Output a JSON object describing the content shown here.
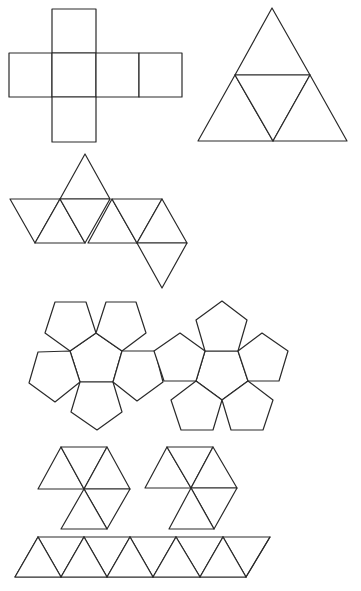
{
  "diagram": {
    "stroke_color": "#2a2a2a",
    "background": "#ffffff",
    "nets": [
      {
        "name": "cube-net",
        "solid": "cube",
        "face_shape": "square",
        "face_count": 6,
        "squares": [
          [
            52,
            9,
            44,
            44
          ],
          [
            9,
            53,
            43,
            44
          ],
          [
            52,
            53,
            44,
            44
          ],
          [
            96,
            53,
            43,
            44
          ],
          [
            139,
            53,
            43,
            44
          ],
          [
            52,
            97,
            44,
            45
          ]
        ]
      },
      {
        "name": "tetrahedron-net",
        "solid": "tetrahedron",
        "face_shape": "triangle",
        "face_count": 4,
        "triangles": [
          [
            [
              272,
              8
            ],
            [
              235,
              75
            ],
            [
              310,
              75
            ]
          ],
          [
            [
              235,
              75
            ],
            [
              198,
              141
            ],
            [
              273,
              141
            ]
          ],
          [
            [
              235,
              75
            ],
            [
              310,
              75
            ],
            [
              273,
              141
            ]
          ],
          [
            [
              310,
              75
            ],
            [
              273,
              141
            ],
            [
              347,
              141
            ]
          ]
        ]
      },
      {
        "name": "octahedron-net",
        "solid": "octahedron",
        "face_shape": "triangle",
        "face_count": 8,
        "triangles": [
          [
            [
              85,
              154
            ],
            [
              60,
              199
            ],
            [
              110,
              199
            ]
          ],
          [
            [
              10,
              199
            ],
            [
              60,
              199
            ],
            [
              35,
              243
            ]
          ],
          [
            [
              60,
              199
            ],
            [
              35,
              243
            ],
            [
              85,
              243
            ]
          ],
          [
            [
              60,
              199
            ],
            [
              110,
              199
            ],
            [
              85,
              243
            ]
          ],
          [
            [
              112,
              199
            ],
            [
              88,
              243
            ],
            [
              137,
              243
            ]
          ],
          [
            [
              112,
              199
            ],
            [
              162,
              199
            ],
            [
              137,
              243
            ]
          ],
          [
            [
              162,
              199
            ],
            [
              137,
              243
            ],
            [
              187,
              243
            ]
          ],
          [
            [
              137,
              243
            ],
            [
              187,
              243
            ],
            [
              162,
              288
            ]
          ]
        ]
      },
      {
        "name": "dodecahedron-net-left",
        "solid": "dodecahedron (half)",
        "face_shape": "pentagon",
        "face_count": 6,
        "pentagons": [
          [
            [
              96,
              333
            ],
            [
              122,
              351
            ],
            [
              113,
              382
            ],
            [
              80,
              382
            ],
            [
              70,
              351
            ]
          ],
          [
            [
              55,
              302
            ],
            [
              86,
              302
            ],
            [
              96,
              333
            ],
            [
              70,
              351
            ],
            [
              45,
              333
            ]
          ],
          [
            [
              106,
              302
            ],
            [
              136,
              302
            ],
            [
              146,
              333
            ],
            [
              122,
              351
            ],
            [
              96,
              333
            ]
          ],
          [
            [
              38,
              352
            ],
            [
              70,
              351
            ],
            [
              80,
              382
            ],
            [
              55,
              402
            ],
            [
              29,
              383
            ]
          ],
          [
            [
              80,
              382
            ],
            [
              113,
              382
            ],
            [
              122,
              412
            ],
            [
              97,
              430
            ],
            [
              71,
              412
            ]
          ],
          [
            [
              122,
              351
            ],
            [
              155,
              351
            ],
            [
              163,
              382
            ],
            [
              137,
              401
            ],
            [
              113,
              382
            ]
          ]
        ]
      },
      {
        "name": "dodecahedron-net-right",
        "solid": "dodecahedron (half)",
        "face_shape": "pentagon",
        "face_count": 6,
        "pentagons": [
          [
            [
              205,
              351
            ],
            [
              238,
              351
            ],
            [
              248,
              381
            ],
            [
              222,
              400
            ],
            [
              196,
              381
            ]
          ],
          [
            [
              222,
              301
            ],
            [
              247,
              320
            ],
            [
              238,
              351
            ],
            [
              205,
              351
            ],
            [
              196,
              320
            ]
          ],
          [
            [
              262,
              333
            ],
            [
              288,
              351
            ],
            [
              279,
              381
            ],
            [
              248,
              381
            ],
            [
              238,
              351
            ]
          ],
          [
            [
              180,
              333
            ],
            [
              205,
              351
            ],
            [
              196,
              381
            ],
            [
              164,
              381
            ],
            [
              154,
              351
            ]
          ],
          [
            [
              196,
              381
            ],
            [
              222,
              400
            ],
            [
              213,
              430
            ],
            [
              181,
              430
            ],
            [
              171,
              400
            ]
          ],
          [
            [
              248,
              381
            ],
            [
              273,
              400
            ],
            [
              263,
              430
            ],
            [
              231,
              430
            ],
            [
              222,
              400
            ]
          ]
        ]
      },
      {
        "name": "icosahedron-cap-left",
        "solid": "icosahedron (cap)",
        "face_shape": "triangle",
        "face_count": 5,
        "triangles": [
          [
            [
              38,
              489
            ],
            [
              61,
              447
            ],
            [
              84,
              489
            ]
          ],
          [
            [
              61,
              447
            ],
            [
              107,
              447
            ],
            [
              84,
              489
            ]
          ],
          [
            [
              107,
              447
            ],
            [
              130,
              489
            ],
            [
              84,
              489
            ]
          ],
          [
            [
              84,
              489
            ],
            [
              130,
              489
            ],
            [
              107,
              529
            ]
          ],
          [
            [
              84,
              489
            ],
            [
              107,
              529
            ],
            [
              61,
              529
            ]
          ]
        ]
      },
      {
        "name": "icosahedron-cap-right",
        "solid": "icosahedron (cap)",
        "face_shape": "triangle",
        "face_count": 5,
        "triangles": [
          [
            [
              145,
              488
            ],
            [
              167,
              447
            ],
            [
              191,
              488
            ]
          ],
          [
            [
              167,
              447
            ],
            [
              213,
              447
            ],
            [
              191,
              488
            ]
          ],
          [
            [
              213,
              447
            ],
            [
              237,
              488
            ],
            [
              191,
              488
            ]
          ],
          [
            [
              191,
              488
            ],
            [
              237,
              488
            ],
            [
              214,
              529
            ]
          ],
          [
            [
              191,
              488
            ],
            [
              214,
              529
            ],
            [
              169,
              529
            ]
          ]
        ]
      },
      {
        "name": "icosahedron-strip",
        "solid": "icosahedron (middle band)",
        "face_shape": "triangle",
        "face_count": 10,
        "top_y": 537,
        "bottom_y": 577,
        "top_x": [
          38,
          84,
          130,
          176,
          223,
          270
        ],
        "bottom_x": [
          15,
          61,
          107,
          153,
          200,
          246
        ]
      }
    ]
  }
}
